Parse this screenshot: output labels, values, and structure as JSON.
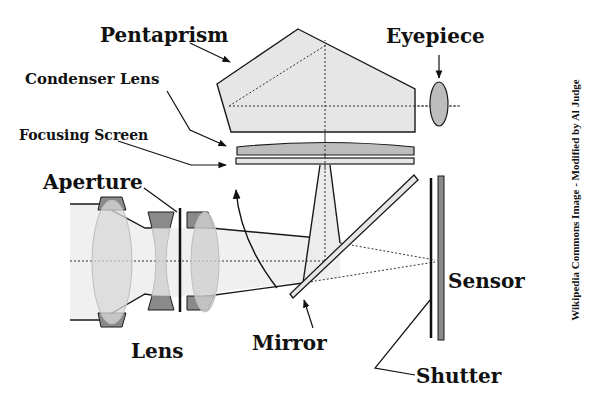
{
  "diagram": {
    "labels": {
      "pentaprism": "Pentaprism",
      "condenser_lens": "Condenser Lens",
      "focusing_screen": "Focusing Screen",
      "aperture": "Aperture",
      "lens": "Lens",
      "mirror": "Mirror",
      "sensor": "Sensor",
      "shutter": "Shutter",
      "eyepiece": "Eyepiece"
    },
    "credit": "Wikipedia Commons Image - Modified by Al Judge"
  },
  "colors": {
    "outline": "#1a1a1a",
    "light_fill": "#e6e6e6",
    "beam_fill": "#efefef",
    "lens_fill": "#d2d2d2",
    "dark_fill": "#8a8a8a",
    "background": "#ffffff"
  }
}
